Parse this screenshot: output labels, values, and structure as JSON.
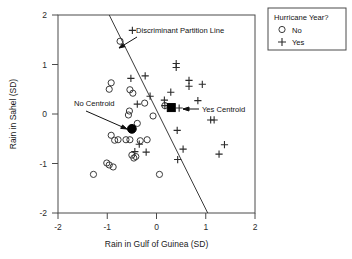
{
  "chart_data": {
    "type": "scatter",
    "title": "",
    "xlabel": "Rain in Gulf of Guinea (SD)",
    "ylabel": "Rain in Sahel (SD)",
    "xlim": [
      -2,
      2
    ],
    "ylim": [
      -2,
      2
    ],
    "xticks": [
      "-2",
      "-1",
      "0",
      "1",
      "2"
    ],
    "yticks": [
      "-2",
      "-1",
      "0",
      "1",
      "2"
    ],
    "xtick_values": [
      -2,
      -1,
      0,
      1,
      2
    ],
    "ytick_values": [
      -2,
      -1,
      0,
      1,
      2
    ],
    "grid": false,
    "legend": {
      "position": "top-right-outside",
      "title": "Hurricane Year?",
      "entries": [
        {
          "marker": "open-circle",
          "label": "No"
        },
        {
          "marker": "plus",
          "label": "Yes"
        }
      ]
    },
    "series": [
      {
        "name": "No",
        "marker": "open-circle",
        "points": [
          [
            -0.74,
            1.47
          ],
          [
            -0.92,
            0.63
          ],
          [
            -0.96,
            0.5
          ],
          [
            -0.54,
            0.49
          ],
          [
            -0.48,
            0.42
          ],
          [
            -0.55,
            0.06
          ],
          [
            -0.57,
            -0.02
          ],
          [
            -0.24,
            0.22
          ],
          [
            0.17,
            0.17
          ],
          [
            -0.07,
            -0.04
          ],
          [
            -0.39,
            -0.19
          ],
          [
            -0.92,
            -0.43
          ],
          [
            -0.85,
            -0.53
          ],
          [
            -0.78,
            -0.52
          ],
          [
            -0.62,
            -0.52
          ],
          [
            -0.54,
            -0.52
          ],
          [
            -0.33,
            -0.54
          ],
          [
            -0.19,
            -0.52
          ],
          [
            -0.5,
            -0.83
          ],
          [
            -0.46,
            -0.89
          ],
          [
            -0.42,
            -0.86
          ],
          [
            -1.01,
            -0.99
          ],
          [
            -0.96,
            -1.03
          ],
          [
            -0.88,
            -1.07
          ],
          [
            -1.28,
            -1.22
          ],
          [
            0.06,
            -1.22
          ]
        ]
      },
      {
        "name": "Yes",
        "marker": "plus",
        "points": [
          [
            -0.49,
            1.69
          ],
          [
            0.4,
            1.02
          ],
          [
            0.4,
            0.94
          ],
          [
            -0.52,
            0.72
          ],
          [
            -0.23,
            0.77
          ],
          [
            0.66,
            0.68
          ],
          [
            0.66,
            0.56
          ],
          [
            0.93,
            0.6
          ],
          [
            0.29,
            0.44
          ],
          [
            -0.13,
            0.36
          ],
          [
            0.16,
            0.28
          ],
          [
            0.84,
            0.27
          ],
          [
            -0.39,
            0.2
          ],
          [
            0.17,
            0.17
          ],
          [
            0.46,
            0.12
          ],
          [
            1.1,
            -0.12
          ],
          [
            1.17,
            -0.12
          ],
          [
            0.42,
            -0.33
          ],
          [
            -0.35,
            -0.61
          ],
          [
            0.54,
            -0.71
          ],
          [
            -0.44,
            -0.76
          ],
          [
            -0.21,
            -0.77
          ],
          [
            1.38,
            -0.62
          ],
          [
            0.43,
            -0.92
          ],
          [
            1.27,
            -0.81
          ]
        ]
      }
    ],
    "centroids": [
      {
        "name": "No Centroid",
        "marker": "filled-circle",
        "x": -0.5,
        "y": -0.3
      },
      {
        "name": "Yes Centroid",
        "marker": "filled-square",
        "x": 0.3,
        "y": 0.13
      }
    ],
    "partition_line": {
      "label": "Discriminant Partition Line",
      "x1": -0.96,
      "y1": 2.0,
      "x2": 1.04,
      "y2": -2.0
    },
    "annotations": [
      {
        "text": "Discriminant Partition Line",
        "target": "partition-line"
      },
      {
        "text": "No Centroid",
        "target": "no-centroid"
      },
      {
        "text": "Yes Centroid",
        "target": "yes-centroid"
      }
    ]
  }
}
